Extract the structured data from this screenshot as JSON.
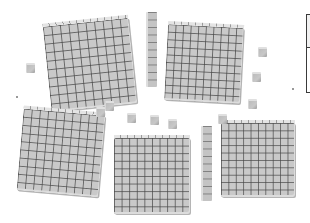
{
  "scene": {
    "title": "Base-ten blocks",
    "colors": {
      "block": "#c9c9c9",
      "grid_line": "#464646",
      "frame": "#3a3a3a",
      "background": "#ffffff"
    },
    "flats": [
      {
        "id": "flat-top-left",
        "left": 47,
        "top": 22,
        "size": 86,
        "rotate": -6,
        "cells": 10
      },
      {
        "id": "flat-top-right",
        "left": 166,
        "top": 26,
        "size": 76,
        "rotate": 3,
        "cells": 10
      },
      {
        "id": "flat-bottom-left",
        "left": 20,
        "top": 112,
        "size": 82,
        "rotate": 5,
        "cells": 10
      },
      {
        "id": "flat-bottom-middle",
        "left": 114,
        "top": 138,
        "size": 76,
        "rotate": 0,
        "cells": 10
      },
      {
        "id": "flat-bottom-right",
        "left": 221,
        "top": 123,
        "size": 74,
        "rotate": 0,
        "cells": 10
      }
    ],
    "rods": [
      {
        "id": "rod-top",
        "left": 146,
        "top": 12,
        "width": 9,
        "height": 75,
        "rotate": 0
      },
      {
        "id": "rod-bottom",
        "left": 201,
        "top": 126,
        "width": 9,
        "height": 75,
        "rotate": 0
      }
    ],
    "units": [
      {
        "id": "unit-1",
        "left": 26,
        "top": 63
      },
      {
        "id": "unit-2",
        "left": 105,
        "top": 101
      },
      {
        "id": "unit-3",
        "left": 127,
        "top": 113
      },
      {
        "id": "unit-4",
        "left": 150,
        "top": 115
      },
      {
        "id": "unit-5",
        "left": 168,
        "top": 119
      },
      {
        "id": "unit-6",
        "left": 258,
        "top": 47
      },
      {
        "id": "unit-7",
        "left": 252,
        "top": 72
      },
      {
        "id": "unit-8",
        "left": 248,
        "top": 99
      },
      {
        "id": "unit-9",
        "left": 96,
        "top": 107
      },
      {
        "id": "unit-10",
        "left": 218,
        "top": 114
      }
    ],
    "frame": {
      "label": ""
    },
    "counts": {
      "hundreds": 5,
      "tens": 2,
      "ones": 10
    }
  }
}
